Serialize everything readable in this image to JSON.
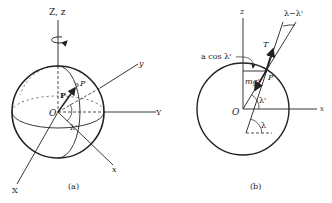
{
  "figure_a": {
    "caption": "(a)",
    "axis_Z": "Z, z",
    "axis_y_small": "y",
    "axis_Y_big": "Y",
    "axis_x_small": "x",
    "axis_X_big": "X",
    "origin": "O",
    "point": "P",
    "vector": "P",
    "angle": "λ'"
  },
  "figure_b": {
    "caption": "(b)",
    "axis_z": "z",
    "axis_x": "x",
    "origin": "O",
    "point": "P",
    "label_acos": "a cos λ'",
    "label_mg": "mg'",
    "label_T": "T",
    "label_diff": "λ−λ'",
    "angle_lambda_prime": "λ'",
    "angle_lambda": "λ"
  },
  "colors": {
    "ink": "#222222",
    "background": "#ffffff"
  }
}
